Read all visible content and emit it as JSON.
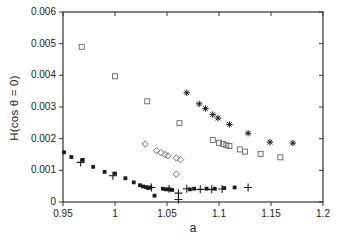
{
  "figure": {
    "background": "#ffffff",
    "axis_color": "#333333",
    "text_color": "#222222",
    "filled_marker_color": "#1a1a1a",
    "open_marker_color": "#666666"
  },
  "chart_data": {
    "type": "scatter",
    "title": "",
    "xlabel": "a",
    "ylabel": "H(cos θ = 0)",
    "xlim": [
      0.95,
      1.2
    ],
    "ylim": [
      0,
      0.006
    ],
    "xticks": [
      0.95,
      1.0,
      1.05,
      1.1,
      1.15,
      1.2
    ],
    "xtick_labels": [
      "0.95",
      "1",
      "1.05",
      "1.1",
      "1.15",
      "1.2"
    ],
    "yticks": [
      0,
      0.001,
      0.002,
      0.003,
      0.004,
      0.005,
      0.006
    ],
    "ytick_labels": [
      "0",
      "0.001",
      "0.002",
      "0.003",
      "0.004",
      "0.005",
      "0.006"
    ],
    "grid": false,
    "legend": "none",
    "series": [
      {
        "name": "open-squares",
        "marker": "open-square",
        "points": [
          [
            0.968,
            0.0049
          ],
          [
            1.0,
            0.00397
          ],
          [
            1.031,
            0.00318
          ],
          [
            1.062,
            0.00249
          ],
          [
            1.094,
            0.00196
          ],
          [
            1.1,
            0.00187
          ],
          [
            1.104,
            0.00183
          ],
          [
            1.107,
            0.00179
          ],
          [
            1.11,
            0.00177
          ],
          [
            1.12,
            0.00166
          ],
          [
            1.125,
            0.00159
          ],
          [
            1.14,
            0.00152
          ],
          [
            1.159,
            0.00141
          ]
        ]
      },
      {
        "name": "open-diamonds",
        "marker": "open-diamond",
        "points": [
          [
            1.029,
            0.00183
          ],
          [
            1.04,
            0.00162
          ],
          [
            1.044,
            0.00156
          ],
          [
            1.048,
            0.0015
          ],
          [
            1.051,
            0.00146
          ],
          [
            1.059,
            0.00139
          ],
          [
            1.063,
            0.00134
          ],
          [
            1.059,
            0.00088
          ]
        ]
      },
      {
        "name": "asterisks",
        "marker": "asterisk",
        "points": [
          [
            1.069,
            0.00345
          ],
          [
            1.081,
            0.0031
          ],
          [
            1.087,
            0.00295
          ],
          [
            1.094,
            0.00276
          ],
          [
            1.099,
            0.00265
          ],
          [
            1.11,
            0.00245
          ],
          [
            1.128,
            0.00217
          ],
          [
            1.149,
            0.00189
          ],
          [
            1.171,
            0.00186
          ]
        ]
      },
      {
        "name": "filled-squares",
        "marker": "filled-square",
        "points": [
          [
            0.951,
            0.00157
          ],
          [
            0.958,
            0.00142
          ],
          [
            0.969,
            0.00133
          ],
          [
            0.979,
            0.00111
          ],
          [
            0.99,
            0.00095
          ],
          [
            1.0,
            0.0009
          ],
          [
            1.01,
            0.00075
          ],
          [
            1.018,
            0.00062
          ],
          [
            1.024,
            0.00053
          ],
          [
            1.027,
            0.00049
          ],
          [
            1.03,
            0.00047
          ],
          [
            1.032,
            0.00044
          ],
          [
            1.034,
            0.00046
          ],
          [
            1.038,
            0.0002
          ],
          [
            1.046,
            0.00042
          ],
          [
            1.049,
            0.0004
          ],
          [
            1.052,
            0.0004
          ],
          [
            1.055,
            0.00038
          ],
          [
            1.072,
            0.0004
          ],
          [
            1.076,
            0.00042
          ],
          [
            1.088,
            0.00042
          ],
          [
            1.096,
            0.00042
          ],
          [
            1.105,
            0.00044
          ],
          [
            1.115,
            0.00046
          ]
        ]
      },
      {
        "name": "plus-signs",
        "marker": "plus",
        "points": [
          [
            0.967,
            0.00125
          ],
          [
            0.998,
            0.00083
          ],
          [
            1.035,
            0.00046
          ],
          [
            1.052,
            0.00042
          ],
          [
            1.061,
            0.00028
          ],
          [
            1.061,
            8e-05
          ],
          [
            1.069,
            0.00042
          ],
          [
            1.082,
            0.0004
          ],
          [
            1.093,
            0.0004
          ],
          [
            1.103,
            0.00041
          ],
          [
            1.128,
            0.00046
          ]
        ]
      }
    ]
  }
}
